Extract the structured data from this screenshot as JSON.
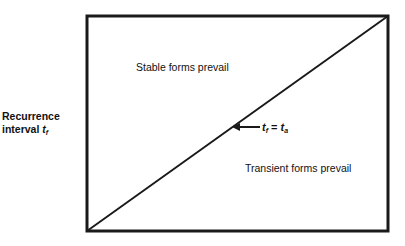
{
  "diagram": {
    "y_axis_label": {
      "line1": "Recurrence",
      "line2_prefix": "interval ",
      "var": "t",
      "sub": "f"
    },
    "regions": {
      "upper": "Stable forms prevail",
      "lower": "Transient forms prevail"
    },
    "diagonal_label": {
      "lhs_var": "t",
      "lhs_sub": "f",
      "equals": " = ",
      "rhs_var": "t",
      "rhs_sub": "a"
    },
    "colors": {
      "line": "#1a1a1a",
      "background": "#ffffff"
    }
  }
}
